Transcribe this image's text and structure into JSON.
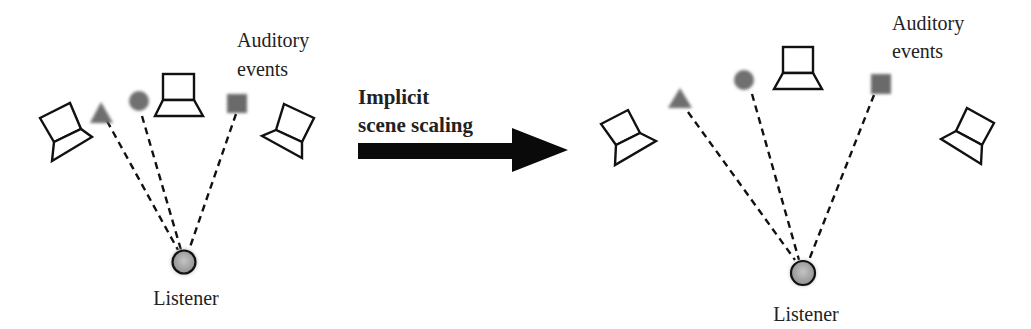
{
  "diagram": {
    "arrow_label_line1": "Implicit",
    "arrow_label_line2": "scene scaling",
    "left_scene": {
      "events_label_line1": "Auditory",
      "events_label_line2": "events",
      "listener_label": "Listener"
    },
    "right_scene": {
      "events_label_line1": "Auditory",
      "events_label_line2": "events",
      "listener_label": "Listener"
    },
    "colors": {
      "outline": "#111111",
      "event_fill": "#6e6e6e",
      "listener_fill": "#a8a8a8",
      "arrow": "#0a0a0a"
    },
    "event_shapes": [
      "triangle",
      "circle",
      "square"
    ]
  }
}
